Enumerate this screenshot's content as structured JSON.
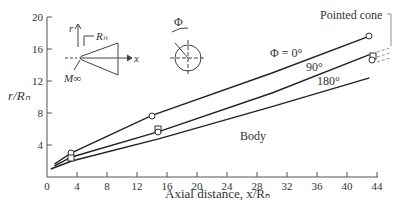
{
  "chart_data": {
    "type": "line",
    "title": "",
    "xlabel": "Axial distance, x/R_n",
    "ylabel": "r/R_n",
    "xlim": [
      0,
      44
    ],
    "ylim": [
      0,
      20
    ],
    "xticks": [
      0,
      4,
      8,
      12,
      16,
      20,
      24,
      28,
      32,
      36,
      40,
      44
    ],
    "yticks": [
      4,
      8,
      12,
      16,
      20
    ],
    "grid": false,
    "series": [
      {
        "name": "Φ = 0°",
        "x": [
          1,
          3.2,
          14,
          30,
          43
        ],
        "y": [
          1.6,
          3.0,
          7.7,
          13.0,
          17.6
        ]
      },
      {
        "name": "90°",
        "x": [
          1,
          3.3,
          15,
          30,
          43
        ],
        "y": [
          1.4,
          2.5,
          5.7,
          10.5,
          15.3
        ]
      },
      {
        "name": "180°",
        "x": [
          0.5,
          3.3,
          15,
          30,
          43
        ],
        "y": [
          1.0,
          2.0,
          4.8,
          8.8,
          12.4
        ]
      }
    ],
    "annotations": [
      "Pointed cone",
      "Body",
      "Φ = 0°",
      "90°",
      "180°",
      "Φ",
      "r",
      "x",
      "R_n",
      "M_∞"
    ]
  },
  "labels": {
    "y_axis": "r/Rₙ",
    "x_axis": "Axial distance, x/Rₙ",
    "pointed_cone": "Pointed cone",
    "body": "Body",
    "phi0": "Φ = 0°",
    "phi90": "90°",
    "phi180": "180°",
    "phi": "Φ",
    "inset_r": "r",
    "inset_x": "x",
    "inset_rn": "Rₙ",
    "inset_minf": "M∞"
  }
}
